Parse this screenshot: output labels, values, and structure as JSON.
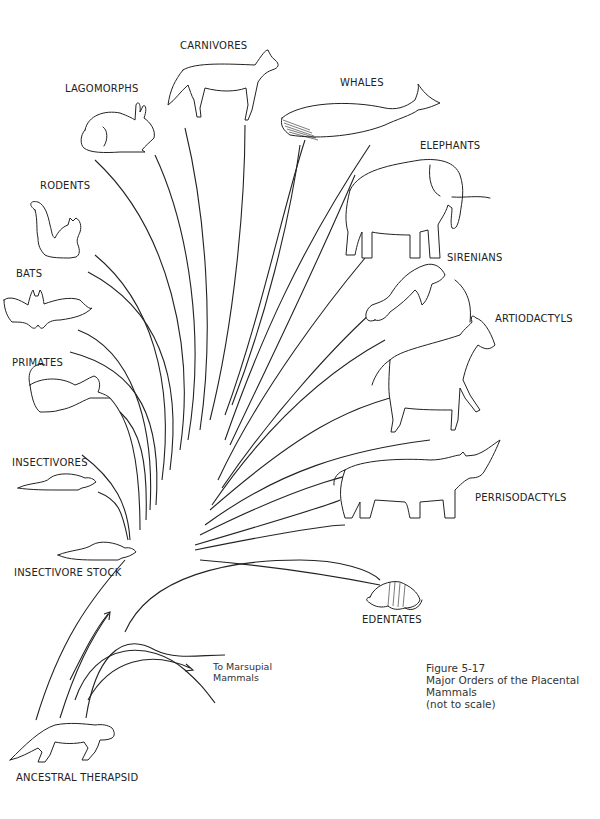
{
  "figure": {
    "number": "Figure 5-17",
    "title_line1": "Major Orders of the Placental",
    "title_line2": "Mammals",
    "note": "(not to scale)"
  },
  "root": {
    "label": "ANCESTRAL THERAPSID"
  },
  "side_branch": {
    "line1": "To Marsupial",
    "line2": "Mammals"
  },
  "orders": [
    {
      "id": "carnivores",
      "label": "CARNIVORES",
      "animal": "dog-like carnivore"
    },
    {
      "id": "lagomorphs",
      "label": "LAGOMORPHS",
      "animal": "rabbit"
    },
    {
      "id": "whales",
      "label": "WHALES",
      "animal": "whale"
    },
    {
      "id": "elephants",
      "label": "ELEPHANTS",
      "animal": "elephant"
    },
    {
      "id": "rodents",
      "label": "RODENTS",
      "animal": "squirrel"
    },
    {
      "id": "bats",
      "label": "BATS",
      "animal": "bat"
    },
    {
      "id": "sirenians",
      "label": "SIRENIANS",
      "animal": "manatee"
    },
    {
      "id": "artiodactyls",
      "label": "ARTIODACTYLS",
      "animal": "antelope"
    },
    {
      "id": "primates",
      "label": "PRIMATES",
      "animal": "primate"
    },
    {
      "id": "insectivores",
      "label": "INSECTIVORES",
      "animal": "shrew"
    },
    {
      "id": "perrisodactyls",
      "label": "PERRISODACTYLS",
      "animal": "rhinoceros"
    },
    {
      "id": "insectivore_stock",
      "label": "INSECTIVORE STOCK",
      "animal": "shrew-like ancestor"
    },
    {
      "id": "edentates",
      "label": "EDENTATES",
      "animal": "armadillo"
    }
  ],
  "colors": {
    "ink": "#222222",
    "paper": "#ffffff"
  }
}
